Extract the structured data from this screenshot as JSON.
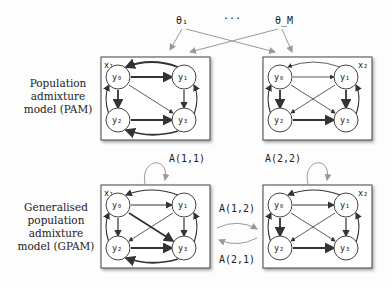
{
  "params": {
    "theta_first": "θ₁",
    "ellipsis": "···",
    "theta_last": "θ_M"
  },
  "pam_label": [
    "Population",
    "admixture",
    "model (PAM)"
  ],
  "gpam_label": [
    "Generalised",
    "population",
    "admixture",
    "model (GPAM)"
  ],
  "boxes": {
    "x1": "x₁",
    "x2": "x₂"
  },
  "nodes": [
    "y₀",
    "y₁",
    "y₂",
    "y₃"
  ],
  "transitions": {
    "a11": "A(1,1)",
    "a22": "A(2,2)",
    "a12": "A(1,2)",
    "a21": "A(2,1)"
  }
}
